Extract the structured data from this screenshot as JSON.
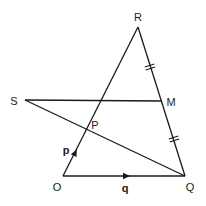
{
  "diagram": {
    "type": "geometry-vector-triangle",
    "colors": {
      "line": "#1a1a1a",
      "text": "#222222",
      "background": "#ffffff"
    },
    "points": {
      "R": {
        "label": "R",
        "x": 138,
        "y": 27,
        "label_x": 138,
        "label_y": 17
      },
      "S": {
        "label": "S",
        "x": 25,
        "y": 100,
        "label_x": 14,
        "label_y": 101
      },
      "M": {
        "label": "M",
        "x": 162,
        "y": 101,
        "label_x": 171,
        "label_y": 102
      },
      "P": {
        "label": "P",
        "x": 87,
        "y": 130,
        "label_x": 95,
        "label_y": 125
      },
      "O": {
        "label": "O",
        "x": 63,
        "y": 176,
        "label_x": 57,
        "label_y": 187
      },
      "Q": {
        "label": "Q",
        "x": 185,
        "y": 176,
        "label_x": 190,
        "label_y": 187
      }
    },
    "vectors": {
      "p": {
        "label": "p",
        "from": "O",
        "to": "R",
        "label_x": 65,
        "label_y": 150
      },
      "q": {
        "label": "q",
        "from": "O",
        "to": "Q",
        "label_x": 125,
        "label_y": 188
      }
    },
    "segments": [
      {
        "from": "O",
        "to": "R"
      },
      {
        "from": "R",
        "to": "Q"
      },
      {
        "from": "O",
        "to": "Q"
      },
      {
        "from": "S",
        "to": "M"
      },
      {
        "from": "S",
        "to": "Q"
      }
    ],
    "equal_marks": [
      {
        "segment": "RM",
        "marks": 2
      },
      {
        "segment": "MQ",
        "marks": 2
      }
    ]
  }
}
